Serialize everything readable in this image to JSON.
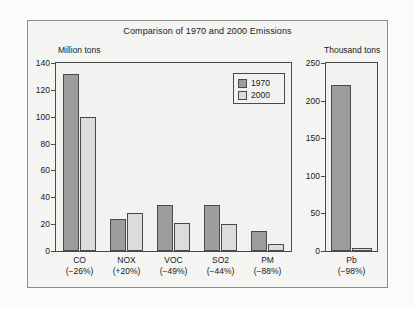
{
  "chart_data": {
    "type": "bar",
    "title": "Comparison of 1970 and 2000 Emissions",
    "panels": [
      {
        "name": "criteria-pollutants",
        "ylabel": "Million tons",
        "ylim": [
          0,
          140
        ],
        "yticks": [
          0,
          20,
          40,
          60,
          80,
          100,
          120,
          140
        ],
        "categories": [
          "CO",
          "NOX",
          "VOC",
          "SO2",
          "PM"
        ],
        "category_changes": [
          "(−26%)",
          "(+20%)",
          "(−49%)",
          "(−44%)",
          "(−88%)"
        ],
        "series": [
          {
            "name": "1970",
            "values": [
              132,
              24,
              34,
              34,
              15
            ]
          },
          {
            "name": "2000",
            "values": [
              100,
              28,
              21,
              20,
              5
            ]
          }
        ]
      },
      {
        "name": "lead",
        "ylabel": "Thousand tons",
        "ylim": [
          0,
          250
        ],
        "yticks": [
          0,
          50,
          100,
          150,
          200,
          250
        ],
        "categories": [
          "Pb"
        ],
        "category_changes": [
          "(−98%)"
        ],
        "series": [
          {
            "name": "1970",
            "values": [
              221
            ]
          },
          {
            "name": "2000",
            "values": [
              4
            ]
          }
        ]
      }
    ],
    "legend": {
      "position": "upper-right-inside-left-panel",
      "entries": [
        {
          "label": "1970",
          "color": "#9d9d9d"
        },
        {
          "label": "2000",
          "color": "#dcdcdc"
        }
      ]
    },
    "grid": false,
    "colors": {
      "series_1970": "#9d9d9d",
      "series_2000": "#dcdcdc",
      "axis": "#4a4a4a",
      "frame": "#8d8d8d",
      "plot_background": "#f2f2f0",
      "figure_background": "#f4f4f2",
      "text": "#1a1a1a"
    }
  }
}
